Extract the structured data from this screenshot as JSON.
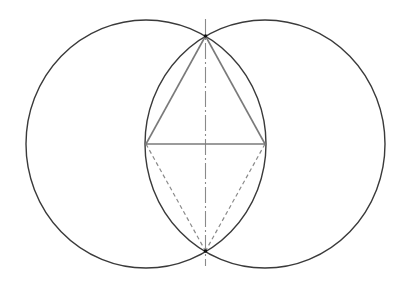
{
  "diagram": {
    "colors": {
      "background": "#ffffff",
      "circle_stroke": "#3a3a3a",
      "triangle_stroke": "#7a7a7a",
      "base_stroke": "#7a7a7a",
      "dashed_stroke": "#8a8a8a",
      "axis_stroke": "#8a8a8a",
      "point_fill": "#111111"
    },
    "circles": [
      {
        "name": "left-circle",
        "cx": 146,
        "cy": 144,
        "rx": 120,
        "ry": 124
      },
      {
        "name": "right-circle",
        "cx": 265,
        "cy": 144,
        "rx": 120,
        "ry": 124
      }
    ],
    "points": {
      "top": {
        "x": 205.5,
        "y": 36
      },
      "bottom": {
        "x": 205.5,
        "y": 251
      },
      "left": {
        "x": 146,
        "y": 144
      },
      "right": {
        "x": 265,
        "y": 144
      }
    },
    "triangle": {
      "vertices": [
        "top",
        "left",
        "right"
      ],
      "style": "solid"
    },
    "base_line": {
      "from": "left",
      "to": "right",
      "style": "solid"
    },
    "lower_triangle": {
      "vertices": [
        "left",
        "bottom",
        "right"
      ],
      "style": "dashed",
      "dash": "4 3"
    },
    "vertical_axis": {
      "x": 205.5,
      "y1": 19,
      "y2": 266,
      "style": "dash-dot",
      "dash": "16 3 2 3"
    }
  }
}
